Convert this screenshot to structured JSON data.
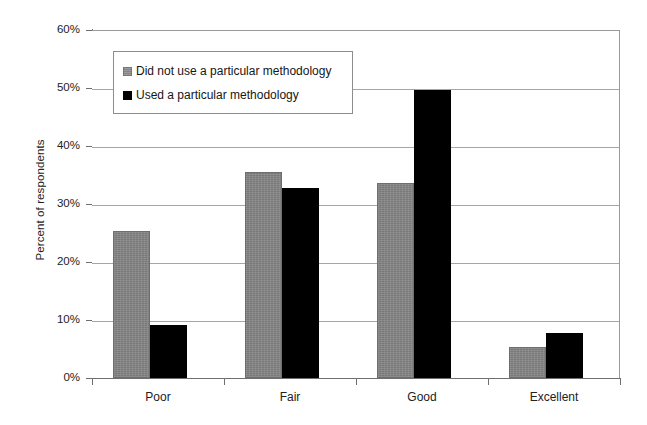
{
  "chart_data": {
    "type": "bar",
    "title": "",
    "subtitle": "",
    "xlabel": "",
    "ylabel": "Percent of respondents",
    "categories": [
      "Poor",
      "Fair",
      "Good",
      "Excellent"
    ],
    "series": [
      {
        "name": "Did not use a particular methodology",
        "color": "#848484",
        "values": [
          25.3,
          35.5,
          33.6,
          5.3
        ]
      },
      {
        "name": "Used a particular methodology",
        "color": "#000000",
        "values": [
          9.1,
          32.8,
          49.6,
          7.8
        ]
      }
    ],
    "ylim": [
      0,
      60
    ],
    "ytick_values": [
      0,
      10,
      20,
      30,
      40,
      50,
      60
    ],
    "ytick_labels": [
      "0%",
      "10%",
      "20%",
      "30%",
      "40%",
      "50%",
      "60%"
    ],
    "grid": true,
    "grid_axis": "y",
    "legend_position": "upper-left-inside",
    "value_unit": "percent"
  },
  "legend": {
    "entries": [
      {
        "label": "Did not use a particular methodology",
        "swatch": "gray-square-icon"
      },
      {
        "label": "Used a particular methodology",
        "swatch": "black-square-icon"
      }
    ]
  },
  "axes": {
    "y_title": "Percent of respondents"
  }
}
